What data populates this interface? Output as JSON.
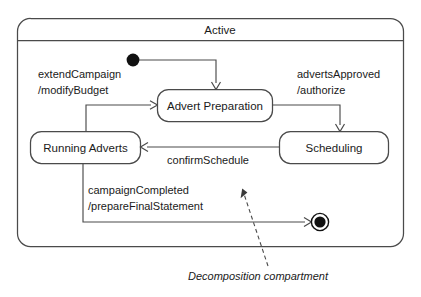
{
  "diagram": {
    "kind": "uml-state-machine",
    "background_color": "#ffffff",
    "line_color": "#4a4a4a",
    "text_color": "#1a1a1a",
    "composite_state": {
      "name": "Active",
      "has_name_compartment": true,
      "has_decomposition_compartment": true
    },
    "states": [
      {
        "id": "advert-preparation",
        "label": "Advert Preparation"
      },
      {
        "id": "scheduling",
        "label": "Scheduling"
      },
      {
        "id": "running-adverts",
        "label": "Running Adverts"
      }
    ],
    "pseudostates": [
      {
        "id": "initial-state",
        "type": "initial"
      },
      {
        "id": "final-state",
        "type": "final"
      }
    ],
    "transitions": [
      {
        "id": "initial-to-advert-preparation",
        "from": "initial-state",
        "to": "advert-preparation",
        "trigger": "",
        "effect": "",
        "label_lines": []
      },
      {
        "id": "advert-preparation-to-scheduling",
        "from": "advert-preparation",
        "to": "scheduling",
        "trigger": "advertsApproved",
        "effect": "/authorize",
        "label_lines": [
          "advertsApproved",
          "/authorize"
        ]
      },
      {
        "id": "scheduling-to-running-adverts",
        "from": "scheduling",
        "to": "running-adverts",
        "trigger": "confirmSchedule",
        "effect": "",
        "label_lines": [
          "confirmSchedule"
        ]
      },
      {
        "id": "running-adverts-to-advert-preparation",
        "from": "running-adverts",
        "to": "advert-preparation",
        "trigger": "extendCampaign",
        "effect": "/modifyBudget",
        "label_lines": [
          "extendCampaign",
          "/modifyBudget"
        ]
      },
      {
        "id": "running-adverts-to-final",
        "from": "running-adverts",
        "to": "final-state",
        "trigger": "campaignCompleted",
        "effect": "/prepareFinalStatement",
        "label_lines": [
          "campaignCompleted",
          "/prepareFinalStatement"
        ]
      }
    ],
    "annotation": {
      "id": "decomposition-compartment-note",
      "text": "Decomposition compartment",
      "style": "italic",
      "leader": "dashed-arrow"
    }
  }
}
